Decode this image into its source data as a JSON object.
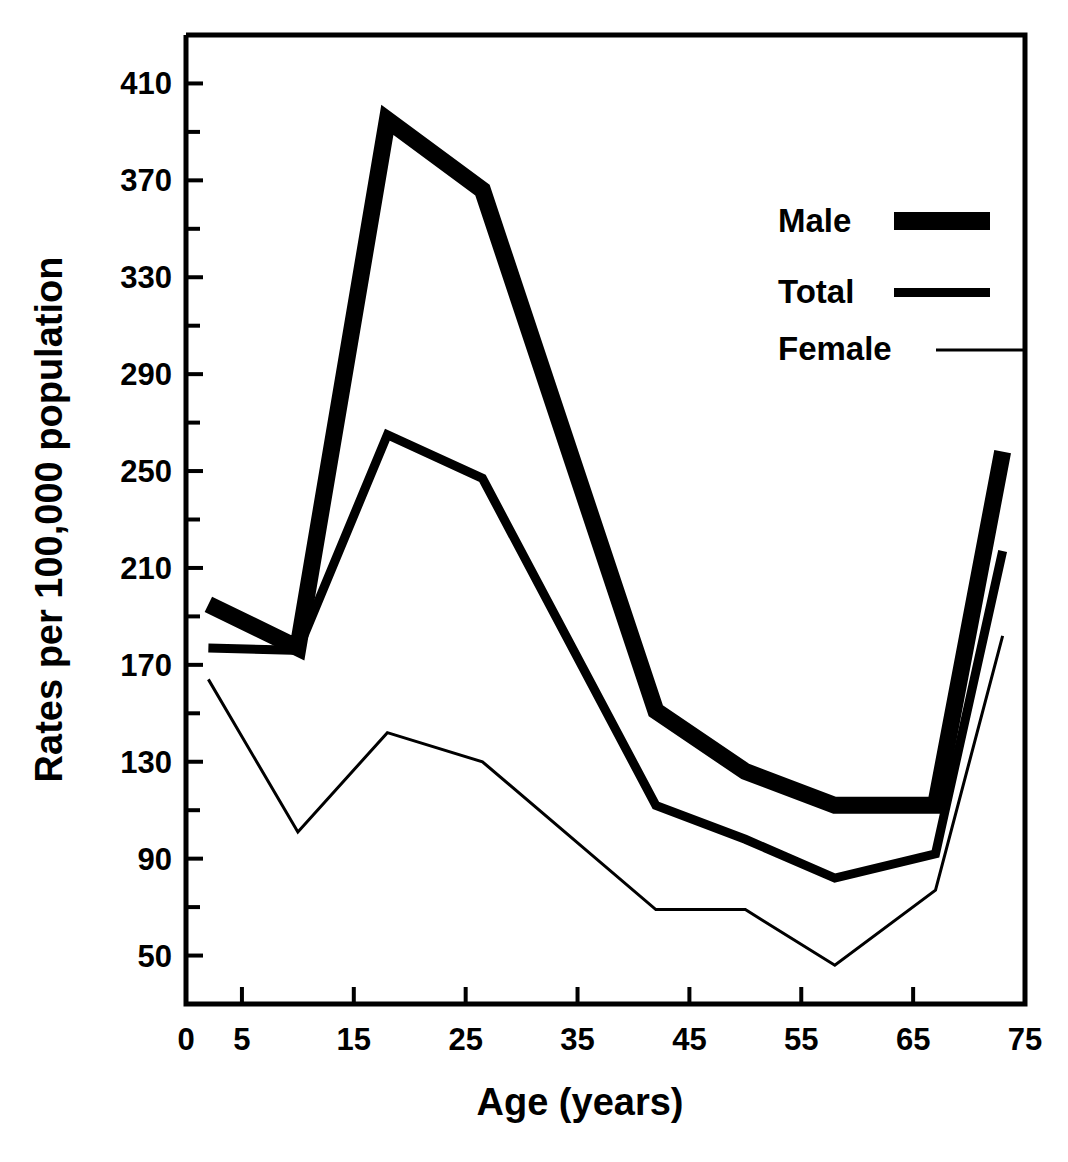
{
  "chart_data": {
    "type": "line",
    "title": "",
    "xlabel": "Age (years)",
    "ylabel": "Rates per 100,000 population",
    "xlim": [
      0,
      75
    ],
    "ylim": [
      30,
      430
    ],
    "grid": false,
    "legend_position": "top-right",
    "x_ticks": [
      0,
      5,
      15,
      25,
      35,
      45,
      55,
      65,
      75
    ],
    "x_tick_labels": [
      "0",
      "5",
      "15",
      "25",
      "35",
      "45",
      "55",
      "65",
      "75"
    ],
    "x_minor_tick_interval": 10,
    "y_ticks": [
      50,
      90,
      130,
      170,
      210,
      250,
      290,
      330,
      370,
      410
    ],
    "y_tick_labels": [
      "50",
      "90",
      "130",
      "170",
      "210",
      "250",
      "290",
      "330",
      "370",
      "410"
    ],
    "y_minor_ticks": [
      70,
      110,
      150,
      190,
      230,
      270,
      310,
      350,
      390
    ],
    "x": [
      2,
      10,
      18,
      26.5,
      42,
      50,
      58,
      67,
      73
    ],
    "series": [
      {
        "name": "Male",
        "line_style": "very-thick",
        "line_width_px": 17,
        "color": "#000000",
        "values": [
          195,
          177,
          395,
          366,
          151,
          126,
          112,
          112,
          258
        ]
      },
      {
        "name": "Total",
        "line_style": "medium",
        "line_width_px": 9,
        "color": "#000000",
        "values": [
          177,
          176,
          265,
          247,
          112,
          98,
          82,
          92,
          217
        ]
      },
      {
        "name": "Female",
        "line_style": "thin",
        "line_width_px": 3,
        "color": "#000000",
        "values": [
          164,
          101,
          142,
          130,
          69,
          69,
          46,
          77,
          182
        ]
      }
    ]
  },
  "legend": {
    "entries": [
      {
        "label": "Male"
      },
      {
        "label": "Total"
      },
      {
        "label": "Female"
      }
    ]
  },
  "axes": {
    "y_title": "Rates per 100,000 population",
    "x_title": "Age (years)"
  }
}
